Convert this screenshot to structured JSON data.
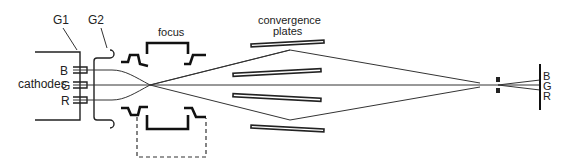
{
  "diagram": {
    "type": "electron-gun-schematic",
    "labels": {
      "g1": "G1",
      "g2": "G2",
      "focus": "focus",
      "convergence": "convergence",
      "plates": "plates",
      "cathodes": "cathodes",
      "cathode_b": "B",
      "cathode_g": "G",
      "cathode_r": "R",
      "screen_b": "B",
      "screen_g": "G",
      "screen_r": "R"
    },
    "components": [
      "cathodes (B, G, R)",
      "G1 grid",
      "G2 grid",
      "focus electrode",
      "convergence plates",
      "aperture",
      "screen"
    ],
    "colors": {
      "line": "#222222",
      "background": "#ffffff"
    }
  }
}
